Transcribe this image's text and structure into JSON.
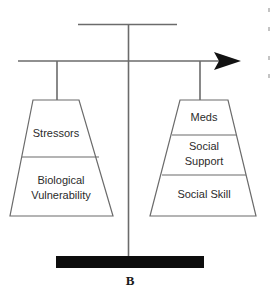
{
  "figure": {
    "label": "B",
    "line_color": "#5a5a5a",
    "base_color": "#000000",
    "text_color": "#2b2b2b",
    "background_color": "#ffffff"
  },
  "scale": {
    "pole_name": "balance-pole",
    "beam_name": "balance-beam",
    "top_bar_name": "top-crossbar",
    "arrow_direction": "right",
    "base_name": "base-block"
  },
  "left_pan": {
    "name": "left-pan",
    "sections": [
      {
        "label": "Stressors",
        "lines": [
          "Stressors"
        ]
      },
      {
        "label": "Biological Vulnerability",
        "lines": [
          "Biological",
          "Vulnerability"
        ]
      }
    ]
  },
  "right_pan": {
    "name": "right-pan",
    "sections": [
      {
        "label": "Meds",
        "lines": [
          "Meds"
        ]
      },
      {
        "label": "Social Support",
        "lines": [
          "Social",
          "Support"
        ]
      },
      {
        "label": "Social Skill",
        "lines": [
          "Social Skill"
        ]
      }
    ]
  },
  "text": {
    "left_s0_l0": "Stressors",
    "left_s1_l0": "Biological",
    "left_s1_l1": "Vulnerability",
    "right_s0_l0": "Meds",
    "right_s1_l0": "Social",
    "right_s1_l1": "Support",
    "right_s2_l0": "Social Skill",
    "figure_label": "B"
  }
}
